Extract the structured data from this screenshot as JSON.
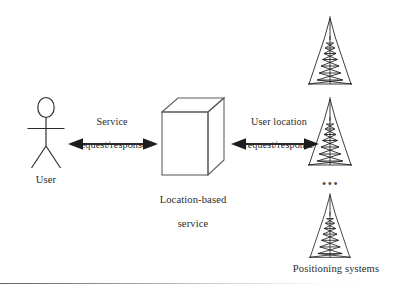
{
  "figure": {
    "background_color": "#ffffff",
    "ink_color": "#2a2a2a"
  },
  "nodes": {
    "user": {
      "label": "User",
      "icon": "stick-figure-person-icon"
    },
    "service": {
      "label": "Location-based\nservice",
      "label_line_1": "Location-based",
      "label_line_2": "service",
      "icon": "3d-cube-icon"
    },
    "positioning": {
      "label": "Positioning systems",
      "icon": "radio-tower-icon",
      "tower_count": 3,
      "ellipsis": "•••"
    }
  },
  "connections": [
    {
      "id": "user-to-service",
      "label": "Service\nrequest/response",
      "label_line_1": "Service",
      "label_line_2": "request/response",
      "arrow": "double-headed-horizontal-arrow"
    },
    {
      "id": "service-to-positioning",
      "label": "User location\nrequest/response",
      "label_line_1": "User location",
      "label_line_2": "request/response",
      "arrow": "double-headed-horizontal-arrow"
    }
  ]
}
